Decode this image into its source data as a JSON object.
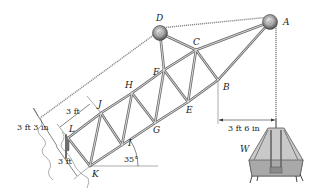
{
  "figure": {
    "type": "crane truss diagram",
    "joints": {
      "A": "A",
      "B": "B",
      "C": "C",
      "D": "D",
      "E": "E",
      "F": "F",
      "G": "G",
      "H": "H",
      "I": "I",
      "J": "J",
      "K": "K",
      "L": "L"
    },
    "load_label": "W",
    "dimensions": {
      "panel_top": "3 ft",
      "depth": "3 ft 3 in",
      "panel_bottom": "3 ft",
      "offset_B_to_A": "3 ft 6 in",
      "angle": "35°"
    }
  }
}
